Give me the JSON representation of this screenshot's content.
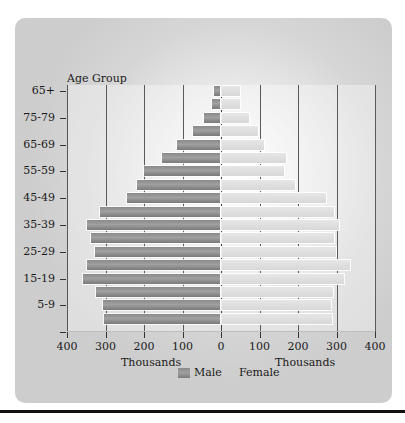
{
  "chart_data": {
    "type": "bar",
    "orientation": "horizontal",
    "subtype": "population-pyramid",
    "title": "Age Group",
    "ylabel": "Age Group",
    "xlabel_left": "Thousands",
    "xlabel_right": "Thousands",
    "x_ticks": [
      "400",
      "300",
      "200",
      "100",
      "0",
      "100",
      "200",
      "300",
      "400"
    ],
    "xlim": [
      -400,
      400
    ],
    "grid": true,
    "legend_position": "bottom",
    "y_tick_labels": [
      "65+",
      "75-79",
      "65-69",
      "55-59",
      "45-49",
      "35-39",
      "25-29",
      "15-19",
      "5-9"
    ],
    "categories_top_to_bottom": [
      "bar1",
      "bar2",
      "bar3",
      "bar4",
      "bar5",
      "bar6",
      "bar7",
      "bar8",
      "bar9",
      "bar10",
      "bar11",
      "bar12",
      "bar13",
      "bar14",
      "bar15",
      "bar16",
      "bar17",
      "bar18"
    ],
    "series": [
      {
        "name": "Male",
        "color": "#8f8f8f",
        "side": "left",
        "values": [
          17,
          24,
          45,
          72,
          114,
          153,
          200,
          218,
          245,
          315,
          348,
          338,
          327,
          348,
          358,
          325,
          306,
          303
        ]
      },
      {
        "name": "Female",
        "color": "#dcdcdc",
        "side": "right",
        "values": [
          47,
          47,
          70,
          93,
          110,
          166,
          162,
          190,
          270,
          290,
          305,
          292,
          297,
          332,
          318,
          288,
          283,
          285
        ]
      }
    ]
  },
  "labels": {
    "title": "Age Group",
    "unit_left": "Thousands",
    "unit_right": "Thousands",
    "legend_male": "Male",
    "legend_female": "Female"
  }
}
